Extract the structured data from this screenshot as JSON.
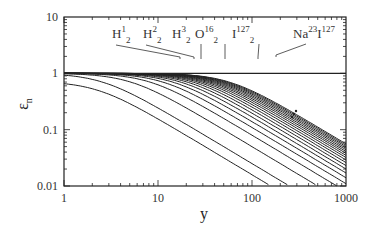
{
  "chart_data": {
    "type": "line",
    "title": "",
    "xlabel": "y",
    "ylabel": "ε_n",
    "xscale": "log",
    "yscale": "log",
    "xlim": [
      1,
      1000
    ],
    "ylim": [
      0.01,
      10
    ],
    "x_ticks": [
      "1",
      "10",
      "100",
      "1000"
    ],
    "y_ticks": [
      "0.01",
      "0.1",
      "1",
      "10"
    ],
    "grid": false,
    "legend": "none",
    "reference_line": {
      "y": 1,
      "description": "horizontal line at epsilon = 1"
    },
    "series_description": "Family of ~20 decreasing curves; each ≈1 at small y then falls with slope ≈ -1 on log-log axes; curves crowd together toward upper right",
    "series": [
      {
        "name": "curve 1",
        "knee_y": 0.7,
        "start_value": 0.72
      },
      {
        "name": "curve 2",
        "knee_y": 2.5
      },
      {
        "name": "curve 3",
        "knee_y": 5
      },
      {
        "name": "curve 4",
        "knee_y": 8
      },
      {
        "name": "curve 5",
        "knee_y": 11
      },
      {
        "name": "curve 6",
        "knee_y": 14
      },
      {
        "name": "curve 7",
        "knee_y": 17
      },
      {
        "name": "curve 8",
        "knee_y": 20
      },
      {
        "name": "curve 9",
        "knee_y": 23
      },
      {
        "name": "curve 10",
        "knee_y": 26
      },
      {
        "name": "curve 11",
        "knee_y": 29
      },
      {
        "name": "curve 12",
        "knee_y": 32
      },
      {
        "name": "curve 13",
        "knee_y": 35
      },
      {
        "name": "curve 14",
        "knee_y": 38
      },
      {
        "name": "curve 15",
        "knee_y": 41
      },
      {
        "name": "curve 16",
        "knee_y": 44
      },
      {
        "name": "curve 17",
        "knee_y": 47
      },
      {
        "name": "curve 18",
        "knee_y": 50
      },
      {
        "name": "curve 19",
        "knee_y": 53
      },
      {
        "name": "curve 20",
        "knee_y": 56
      }
    ],
    "annotations": [
      {
        "label": "H",
        "sup": "1",
        "sub": "2",
        "points_to_x": 18
      },
      {
        "label": "H",
        "sup": "2",
        "sub": "2",
        "points_to_x": 24
      },
      {
        "label": "H",
        "sup": "3",
        "sub": "2",
        "points_to_x": 29
      },
      {
        "label": "O",
        "sup": "16",
        "sub": "2",
        "points_to_x": 52
      },
      {
        "label": "I",
        "sup": "127",
        "sub": "2",
        "points_to_x": 115
      },
      {
        "label": "Na",
        "sup": "23",
        "sub": "",
        "label2": "I",
        "sup2": "127",
        "points_to_x": 165
      }
    ],
    "ellipsis_marker": "⋮"
  },
  "labels": {
    "xlabel": "y",
    "ylabel_main": "ε",
    "ylabel_sub": "n",
    "x_ticks": [
      "1",
      "10",
      "100",
      "1000"
    ],
    "y_ticks": [
      "10",
      "1",
      "0.1",
      "0.01"
    ]
  }
}
